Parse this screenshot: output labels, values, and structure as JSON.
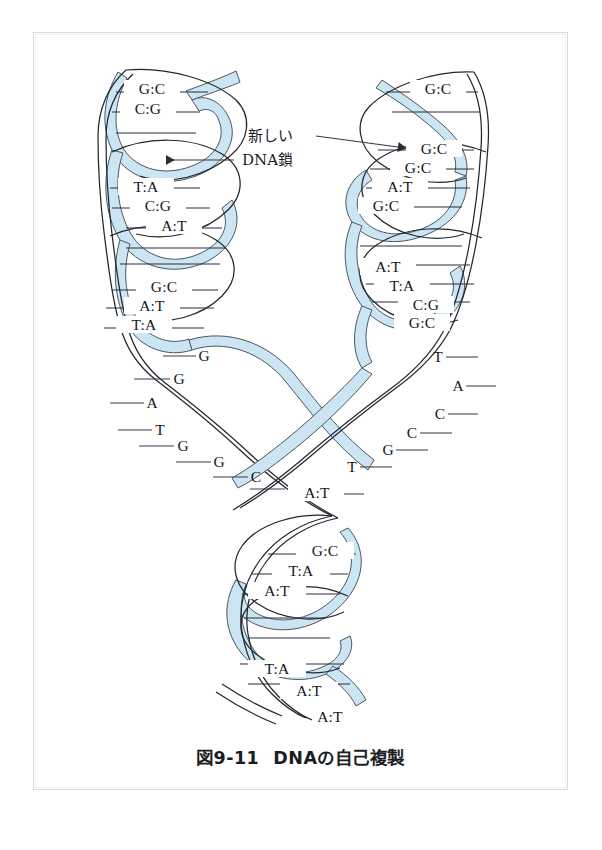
{
  "figure": {
    "caption_number": "図9-11",
    "caption_title": "DNAの自己複製",
    "annotation": {
      "line1": "新しい",
      "line2": "DNA鎖"
    },
    "colors": {
      "new_strand_fill": "#cbe5f2",
      "new_strand_stroke": "#4a5560",
      "backbone_stroke": "#22262e",
      "frame_border": "#d2dde4",
      "text": "#14161c",
      "background": "#ffffff"
    }
  },
  "left_branch": {
    "name": "left-daughter-helix",
    "base_pairs": [
      "G:C",
      "C:G",
      "T:A",
      "C:G",
      "A:T",
      "G:C",
      "A:T",
      "T:A"
    ]
  },
  "right_branch": {
    "name": "right-daughter-helix",
    "base_pairs": [
      "G:C",
      "G:C",
      "G:C",
      "A:T",
      "G:C",
      "A:T",
      "T:A",
      "C:G",
      "G:C"
    ]
  },
  "left_fork_bases": {
    "name": "left-unpaired-template-bases",
    "bases": [
      "G",
      "G",
      "A",
      "T",
      "G",
      "G",
      "C",
      "A"
    ]
  },
  "right_fork_bases": {
    "name": "right-unpaired-template-bases",
    "bases": [
      "T",
      "A",
      "C",
      "C",
      "G",
      "T"
    ]
  },
  "fork_junction": {
    "name": "replication-fork-junction",
    "base_pairs": [
      "A:T"
    ]
  },
  "parent_stem": {
    "name": "parental-duplex-stem",
    "base_pairs": [
      "G:C",
      "T:A",
      "A:T",
      "T:A",
      "A:T",
      "A:T"
    ]
  }
}
